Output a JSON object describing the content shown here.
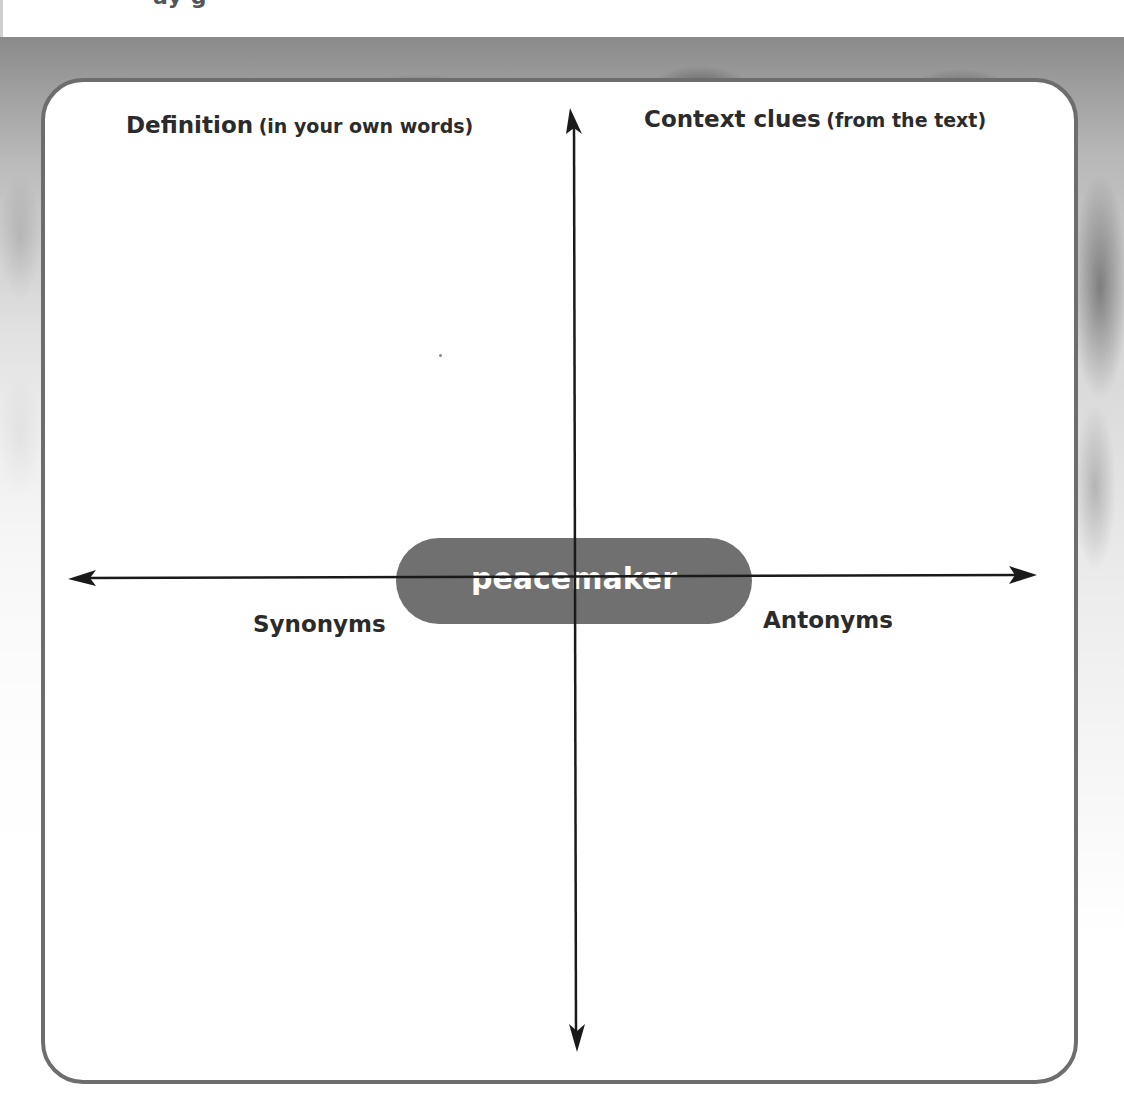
{
  "page": {
    "cropped_heading_fragment": "ay   g"
  },
  "organizer": {
    "center_word": "peacemaker",
    "quadrants": {
      "top_left": {
        "main": "Definition",
        "sub": "(in your own words)"
      },
      "top_right": {
        "main": "Context clues",
        "sub": "(from the text)"
      },
      "bottom_left": {
        "main": "Synonyms"
      },
      "bottom_right": {
        "main": "Antonyms"
      }
    },
    "colors": {
      "frame_border": "#6d6d6d",
      "pill_fill": "#707070",
      "pill_text": "#ffffff",
      "label_text": "#2b2b2b",
      "axis": "#1a1a1a"
    },
    "icons": {
      "axis_arrows": [
        "arrow-up-icon",
        "arrow-down-icon",
        "arrow-left-icon",
        "arrow-right-icon"
      ]
    }
  }
}
